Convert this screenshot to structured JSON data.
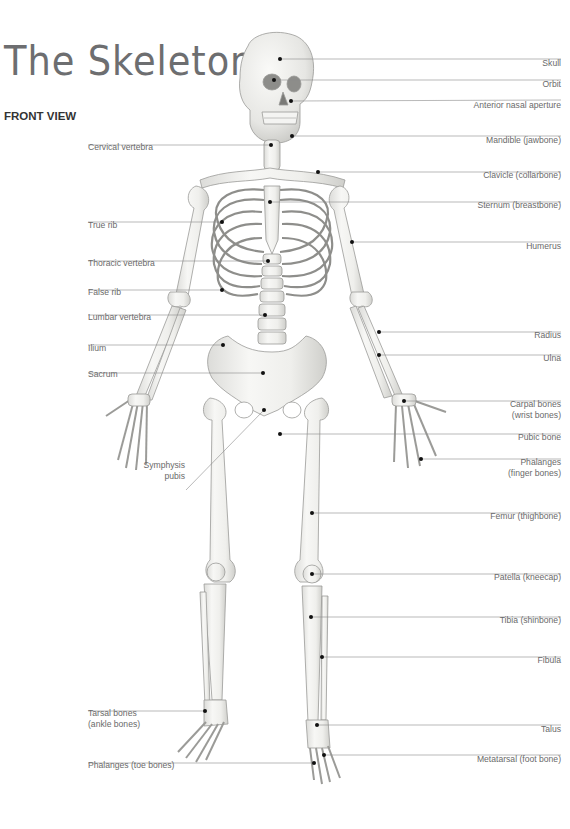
{
  "header": {
    "title": "The Skeleton",
    "subtitle": "FRONT VIEW"
  },
  "colors": {
    "title": "#6d6e70",
    "label_text": "#6a6a6a",
    "leader_line": "#8a8a8a",
    "bone_fill": "#f1f1ef",
    "bone_stroke": "#9b9b98",
    "marker": "#111111"
  },
  "labels_left": [
    {
      "id": "cervical-vertebra",
      "text": "Cervical vertebra",
      "line_y": 145,
      "dot_x": 271,
      "dot_y": 145,
      "text_y": 150
    },
    {
      "id": "true-rib",
      "text": "True rib",
      "line_y": 222,
      "dot_x": 222,
      "dot_y": 222,
      "text_y": 228
    },
    {
      "id": "thoracic-vertebra",
      "text": "Thoracic vertebra",
      "line_y": 261,
      "dot_x": 268,
      "dot_y": 261,
      "text_y": 266
    },
    {
      "id": "false-rib",
      "text": "False rib",
      "line_y": 290,
      "dot_x": 222,
      "dot_y": 290,
      "text_y": 295
    },
    {
      "id": "lumbar-vertebra",
      "text": "Lumbar vertebra",
      "line_y": 315,
      "dot_x": 265,
      "dot_y": 315,
      "text_y": 320
    },
    {
      "id": "ilium",
      "text": "Ilium",
      "line_y": 345,
      "dot_x": 223,
      "dot_y": 345,
      "text_y": 351
    },
    {
      "id": "sacrum",
      "text": "Sacrum",
      "line_y": 373,
      "dot_x": 263,
      "dot_y": 373,
      "text_y": 377
    },
    {
      "id": "tarsal-bones",
      "text": "Tarsal bones",
      "text2": "(ankle bones)",
      "line_y": 711,
      "dot_x": 205,
      "dot_y": 711,
      "text_y": 716
    },
    {
      "id": "phalanges-toe",
      "text": "Phalanges (toe bones)",
      "line_y": 763,
      "dot_x": 314,
      "dot_y": 763,
      "text_y": 768
    }
  ],
  "labels_right": [
    {
      "id": "skull",
      "text": "Skull",
      "line_y": 59,
      "dot_x": 280,
      "dot_y": 59,
      "text_y": 66
    },
    {
      "id": "orbit",
      "text": "Orbit",
      "line_y": 80,
      "dot_x": 274,
      "dot_y": 80,
      "text_y": 87
    },
    {
      "id": "anterior-nasal-aperture",
      "text": "Anterior nasal aperture",
      "line_y": 100,
      "dot_x": 291,
      "dot_y": 101,
      "text_y": 108
    },
    {
      "id": "mandible",
      "text": "Mandible (jawbone)",
      "line_y": 136,
      "dot_x": 292,
      "dot_y": 136,
      "text_y": 143
    },
    {
      "id": "clavicle",
      "text": "Clavicle (collarbone)",
      "line_y": 172,
      "dot_x": 318,
      "dot_y": 172,
      "text_y": 178
    },
    {
      "id": "sternum",
      "text": "Sternum (breastbone)",
      "line_y": 202,
      "dot_x": 270,
      "dot_y": 202,
      "text_y": 208
    },
    {
      "id": "humerus",
      "text": "Humerus",
      "line_y": 242,
      "dot_x": 352,
      "dot_y": 242,
      "text_y": 249
    },
    {
      "id": "radius",
      "text": "Radius",
      "line_y": 332,
      "dot_x": 379,
      "dot_y": 332,
      "text_y": 338
    },
    {
      "id": "ulna",
      "text": "Ulna",
      "line_y": 355,
      "dot_x": 379,
      "dot_y": 355,
      "text_y": 361
    },
    {
      "id": "carpal-bones",
      "text": "Carpal bones",
      "text2": "(wrist bones)",
      "line_y": 401,
      "dot_x": 404,
      "dot_y": 401,
      "text_y": 407
    },
    {
      "id": "pubic-bone",
      "text": "Pubic bone",
      "line_y": 434,
      "dot_x": 280,
      "dot_y": 434,
      "text_y": 440
    },
    {
      "id": "phalanges-finger",
      "text": "Phalanges",
      "text2": "(finger bones)",
      "line_y": 459,
      "dot_x": 421,
      "dot_y": 459,
      "text_y": 465
    },
    {
      "id": "femur",
      "text": "Femur (thighbone)",
      "line_y": 513,
      "dot_x": 312,
      "dot_y": 513,
      "text_y": 519
    },
    {
      "id": "patella",
      "text": "Patella (kneecap)",
      "line_y": 574,
      "dot_x": 312,
      "dot_y": 574,
      "text_y": 580
    },
    {
      "id": "tibia",
      "text": "Tibia (shinbone)",
      "line_y": 617,
      "dot_x": 311,
      "dot_y": 617,
      "text_y": 623
    },
    {
      "id": "fibula",
      "text": "Fibula",
      "line_y": 657,
      "dot_x": 322,
      "dot_y": 657,
      "text_y": 663
    },
    {
      "id": "talus",
      "text": "Talus",
      "line_y": 725,
      "dot_x": 317,
      "dot_y": 725,
      "text_y": 732
    },
    {
      "id": "metatarsal",
      "text": "Metatarsal (foot bone)",
      "line_y": 755,
      "dot_x": 324,
      "dot_y": 755,
      "text_y": 762
    }
  ],
  "label_symphysis": {
    "id": "symphysis-pubis",
    "text": "Symphysis",
    "text2": "pubis",
    "dot_x": 264,
    "dot_y": 410,
    "text_y": 468
  }
}
